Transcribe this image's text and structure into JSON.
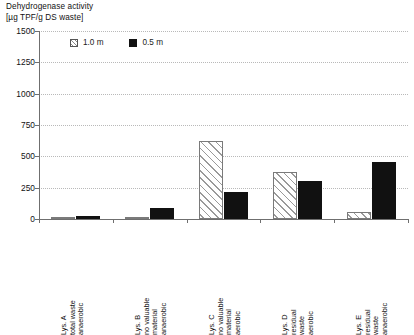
{
  "chart_data": {
    "type": "bar",
    "title": "Dehydrogenase activity\n[µg TPF/g DS waste]",
    "title_line1": "Dehydrogenase activity",
    "title_line2": "[µg TPF/g DS waste]",
    "xlabel": "",
    "ylabel": "Dehydrogenase activity [µg TPF/g DS waste]",
    "ylim": [
      0,
      1500
    ],
    "ytick_values": [
      0,
      250,
      500,
      750,
      1000,
      1250,
      1500
    ],
    "ytick_labels": [
      "0",
      "250",
      "500",
      "750",
      "1000",
      "1250",
      "1500"
    ],
    "grid": "horizontal-dotted",
    "legend_position": "top-left-inside",
    "categories": [
      "Lys. A\ntotal waste\nanaerobic",
      "Lys. B\nno valuable\nmaterial\nanaerobic",
      "Lys. C\nno valuable\nmaterial\naerobic",
      "Lys. D\nresidual\nwaste\naerobic",
      "Lys. E\nresidual\nwaste\nanaerobic"
    ],
    "series": [
      {
        "name": "1.0 m",
        "style": "hatched",
        "color": "#ffffff",
        "values": [
          15,
          15,
          620,
          375,
          55
        ]
      },
      {
        "name": "0.5 m",
        "style": "solid",
        "color": "#111111",
        "values": [
          25,
          85,
          215,
          305,
          455
        ]
      }
    ]
  },
  "legend": {
    "entries": [
      {
        "label": "1.0 m",
        "swatch": "hatched-square-icon"
      },
      {
        "label": "0.5 m",
        "swatch": "filled-square-icon"
      }
    ]
  }
}
